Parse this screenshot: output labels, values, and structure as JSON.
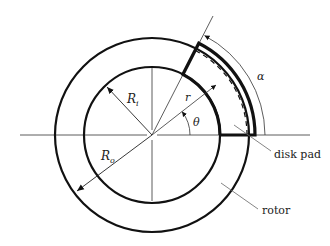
{
  "diagram": {
    "labels": {
      "alpha": "α",
      "theta": "θ",
      "r": "r",
      "r_inner": "R",
      "r_inner_sub": "i",
      "r_outer": "R",
      "r_outer_sub": "o",
      "disk_pad": "disk pad",
      "rotor": "rotor"
    },
    "geometry": {
      "center": [
        152,
        135
      ],
      "rotor_inner_radius": 68,
      "rotor_outer_radius": 97,
      "pad_outer_radius": 103,
      "pad_angle_deg": 63,
      "dashed_radius": 95,
      "r_arrow_angle_deg": 38
    },
    "colors": {
      "line": "#111111",
      "thin": "#333333",
      "leader": "#666666",
      "background": "#ffffff"
    }
  }
}
